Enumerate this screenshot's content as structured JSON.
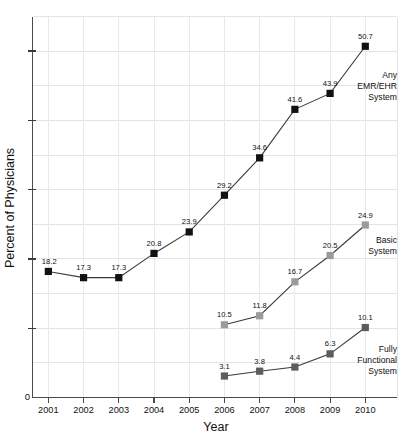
{
  "chart_data": {
    "type": "line",
    "title": "",
    "xlabel": "Year",
    "ylabel": "Percent of Physicians",
    "categories": [
      "2001",
      "2002",
      "2003",
      "2004",
      "2005",
      "2006",
      "2007",
      "2008",
      "2009",
      "2010"
    ],
    "x": [
      2001,
      2002,
      2003,
      2004,
      2005,
      2006,
      2007,
      2008,
      2009,
      2010
    ],
    "xlim": [
      2000.55,
      2010.9
    ],
    "ylim": [
      0,
      55
    ],
    "grid": true,
    "legend_position": "inline-right-of-series",
    "y_tick_labels": [
      "0"
    ],
    "series": [
      {
        "name": "Any EMR/EHR System",
        "annotation": [
          "Any",
          "EMR/EHR",
          "System"
        ],
        "color": "#111111",
        "marker": "square",
        "x": [
          2001,
          2002,
          2003,
          2004,
          2005,
          2006,
          2007,
          2008,
          2009,
          2010
        ],
        "values": [
          18.2,
          17.3,
          17.3,
          20.8,
          23.9,
          29.2,
          34.6,
          41.6,
          43.9,
          50.7
        ],
        "labels": [
          "18.2",
          "17.3",
          "17.3",
          "20.8",
          "23.9",
          "29.2",
          "34.6",
          "41.6",
          "43.9",
          "50.7"
        ]
      },
      {
        "name": "Basic System",
        "annotation": [
          "Basic",
          "System"
        ],
        "color": "#9b9b9b",
        "marker": "square",
        "x": [
          2006,
          2007,
          2008,
          2009,
          2010
        ],
        "values": [
          10.5,
          11.8,
          16.7,
          20.5,
          24.9
        ],
        "labels": [
          "10.5",
          "11.8",
          "16.7",
          "20.5",
          "24.9"
        ]
      },
      {
        "name": "Fully Functional System",
        "annotation": [
          "Fully",
          "Functional",
          "System"
        ],
        "color": "#5c5c5c",
        "marker": "square",
        "x": [
          2006,
          2007,
          2008,
          2009,
          2010
        ],
        "values": [
          3.1,
          3.8,
          4.4,
          6.3,
          10.1
        ],
        "labels": [
          "3.1",
          "3.8",
          "4.4",
          "6.3",
          "10.1"
        ]
      }
    ]
  },
  "axes": {
    "y_zero_label": "0",
    "y_title": "Percent of Physicians",
    "x_title": "Year"
  },
  "annotations": {
    "any_emr": {
      "line1": "Any",
      "line2": "EMR/EHR",
      "line3": "System"
    },
    "basic": {
      "line1": "Basic",
      "line2": "System"
    },
    "fully": {
      "line1": "Fully",
      "line2": "Functional",
      "line3": "System"
    }
  }
}
